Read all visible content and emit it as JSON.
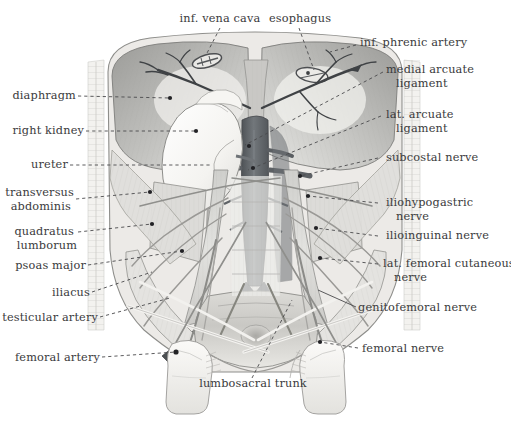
{
  "figure": {
    "style": "grayscale pencil/wash anatomical illustration",
    "width": 511,
    "height": 422,
    "background_color": "#ffffff",
    "label_color": "#3a3a3c",
    "leader_line_color": "#4a4a4c",
    "leader_line_style": "dashed"
  },
  "labels": {
    "inf_vena_cava": "inf. vena cava",
    "esophagus": "esophagus",
    "inf_phrenic_artery": "inf. phrenic artery",
    "medial_arcuate_ligament_l1": "medial arcuate",
    "medial_arcuate_ligament_l2": "ligament",
    "lat_arcuate_ligament_l1": "lat. arcuate",
    "lat_arcuate_ligament_l2": "ligament",
    "subcostal_nerve": "subcostal nerve",
    "iliohypogastric_nerve_l1": "iliohypogastric",
    "iliohypogastric_nerve_l2": "nerve",
    "ilioinguinal_nerve": "ilioinguinal nerve",
    "lat_femoral_cutaneous_nerve_l1": "lat. femoral cutaneous",
    "lat_femoral_cutaneous_nerve_l2": "nerve",
    "genitofemoral_nerve": "genitofemoral nerve",
    "femoral_nerve": "femoral nerve",
    "diaphragm": "diaphragm",
    "right_kidney": "right kidney",
    "ureter": "ureter",
    "transversus_abdominis_l1": "transversus",
    "transversus_abdominis_l2": "abdominis",
    "quadratus_lumborum_l1": "quadratus",
    "quadratus_lumborum_l2": "lumborum",
    "psoas_major": "psoas major",
    "iliacus": "iliacus",
    "testicular_artery": "testicular artery",
    "femoral_artery": "femoral artery",
    "lumbosacral_trunk": "lumbosacral trunk"
  },
  "structures": {
    "aorta": "abdominal aorta",
    "ivc": "inferior vena cava",
    "diaphragm_dome": "diaphragm",
    "kidney": "right kidney",
    "vertebral_column": "lumbar vertebral column",
    "sacrum": "sacrum",
    "femur_left": "left femur head",
    "femur_right": "right femur head",
    "ribs": "costal margin"
  },
  "colors": {
    "vessel_dark": "#5b5f63",
    "vessel_mid": "#70757a",
    "muscle_light": "#d9d9d7",
    "muscle_mid": "#b5b5b2",
    "muscle_dark": "#8d8d8a",
    "bone_pale": "#f0efec",
    "kidney_pale": "#f7f6f3",
    "outline": "#6e6e6e"
  }
}
